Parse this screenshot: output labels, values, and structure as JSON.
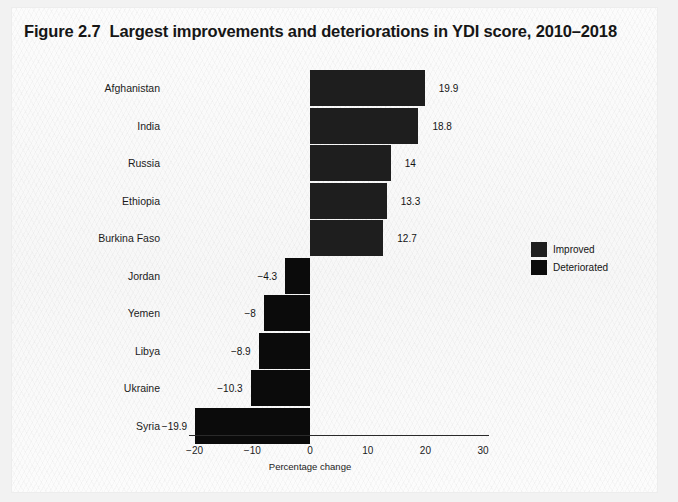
{
  "figure": {
    "number": "Figure 2.7",
    "title": "Largest improvements and deteriorations in YDI score, 2010–2018"
  },
  "legend": {
    "position": "middle-right",
    "items": [
      {
        "label": "Improved",
        "color": "#1e1e1e"
      },
      {
        "label": "Deteriorated",
        "color": "#0b0b0b"
      }
    ]
  },
  "chart_data": {
    "type": "bar",
    "orientation": "horizontal",
    "xlabel": "Percentage change",
    "ylabel": "",
    "xlim": [
      -23,
      34
    ],
    "xticks": [
      -20,
      -10,
      0,
      10,
      20,
      30
    ],
    "xtick_labels": [
      "−20",
      "−10",
      "0",
      "10",
      "20",
      "30"
    ],
    "grid": false,
    "legend": [
      "Improved",
      "Deteriorated"
    ],
    "categories": [
      "Afghanistan",
      "India",
      "Russia",
      "Ethiopia",
      "Burkina Faso",
      "Jordan",
      "Yemen",
      "Libya",
      "Ukraine",
      "Syria"
    ],
    "values": [
      19.9,
      18.8,
      14,
      13.3,
      12.7,
      -4.3,
      -8,
      -8.9,
      -10.3,
      -19.9
    ],
    "value_labels": [
      "19.9",
      "18.8",
      "14",
      "13.3",
      "12.7",
      "−4.3",
      "−8",
      "−8.9",
      "−10.3",
      "−19.9"
    ],
    "series_assignment": [
      "Improved",
      "Improved",
      "Improved",
      "Improved",
      "Improved",
      "Deteriorated",
      "Deteriorated",
      "Deteriorated",
      "Deteriorated",
      "Deteriorated"
    ]
  }
}
